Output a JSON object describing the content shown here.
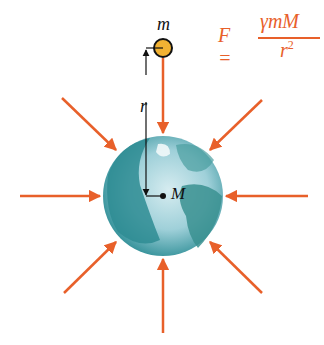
{
  "diagram": {
    "labels": {
      "small_mass": "m",
      "large_mass": "M",
      "distance": "r"
    },
    "formula": {
      "lhs": "F =",
      "numerator": "γmM",
      "denominator": "r",
      "exponent": "2"
    },
    "colors": {
      "arrow": "#e8602a",
      "formula": "#e8602a",
      "mass_fill": "#f2b233",
      "earth_dark": "#2a8a8e",
      "earth_light": "#c9e4ea"
    },
    "arrows": [
      "top",
      "top-right",
      "right",
      "bottom-right",
      "bottom",
      "bottom-left",
      "left",
      "top-left"
    ]
  }
}
